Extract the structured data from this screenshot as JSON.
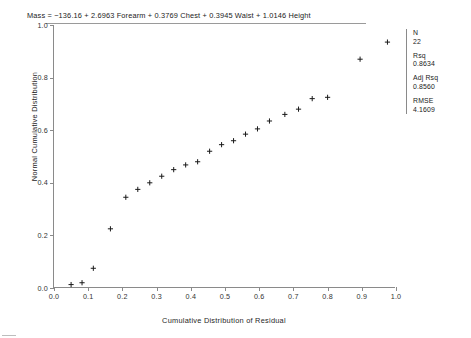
{
  "equation": {
    "label": "Mass",
    "text": "Mass  =   −136.16  + 2.6963 Forearm  + 0.3769 Chest  + 0.3945 Waist  + 1.0146 Height"
  },
  "stats": {
    "n_label": "N",
    "n_value": "22",
    "rsq_label": "Rsq",
    "rsq_value": "0.8634",
    "adj_rsq_label": "Adj Rsq",
    "adj_rsq_value": "0.8560",
    "rmse_label": "RMSE",
    "rmse_value": "4.1609"
  },
  "chart_data": {
    "type": "scatter",
    "title": "",
    "xlabel": "Cumulative Distribution of Residual",
    "ylabel": "Normal Cumulative Distribution",
    "xlim": [
      0.0,
      1.0
    ],
    "ylim": [
      0.0,
      1.0
    ],
    "grid": false,
    "legend": "none",
    "marker": "plus",
    "marker_color": "#1a1a1a",
    "xticks": [
      0.0,
      0.1,
      0.2,
      0.3,
      0.4,
      0.5,
      0.6,
      0.7,
      0.8,
      0.9,
      1.0
    ],
    "xticklabels": [
      "0.0",
      "0.1",
      "0.2",
      "0.3",
      "0.4",
      "0.5",
      "0.6",
      "0.7",
      "0.8",
      "0.9",
      "1.0"
    ],
    "yticks": [
      0.0,
      0.2,
      0.4,
      0.6,
      0.8,
      1.0
    ],
    "yticklabels": [
      "0.0",
      "0.2",
      "0.4",
      "0.6",
      "0.8",
      "1.0"
    ],
    "n_points": 22,
    "x": [
      0.05,
      0.082,
      0.115,
      0.165,
      0.21,
      0.245,
      0.28,
      0.315,
      0.35,
      0.385,
      0.42,
      0.455,
      0.49,
      0.525,
      0.56,
      0.595,
      0.63,
      0.675,
      0.715,
      0.755,
      0.8,
      0.895,
      0.975
    ],
    "y": [
      0.013,
      0.02,
      0.075,
      0.225,
      0.345,
      0.375,
      0.4,
      0.425,
      0.45,
      0.47,
      0.48,
      0.52,
      0.545,
      0.56,
      0.585,
      0.605,
      0.635,
      0.66,
      0.68,
      0.72,
      0.725,
      0.87,
      0.935
    ],
    "points": [
      {
        "x": 0.05,
        "y": 0.013
      },
      {
        "x": 0.082,
        "y": 0.02
      },
      {
        "x": 0.115,
        "y": 0.075
      },
      {
        "x": 0.165,
        "y": 0.225
      },
      {
        "x": 0.21,
        "y": 0.345
      },
      {
        "x": 0.245,
        "y": 0.375
      },
      {
        "x": 0.28,
        "y": 0.4
      },
      {
        "x": 0.315,
        "y": 0.425
      },
      {
        "x": 0.35,
        "y": 0.45
      },
      {
        "x": 0.385,
        "y": 0.468
      },
      {
        "x": 0.42,
        "y": 0.48
      },
      {
        "x": 0.455,
        "y": 0.52
      },
      {
        "x": 0.49,
        "y": 0.545
      },
      {
        "x": 0.525,
        "y": 0.56
      },
      {
        "x": 0.56,
        "y": 0.585
      },
      {
        "x": 0.595,
        "y": 0.605
      },
      {
        "x": 0.63,
        "y": 0.635
      },
      {
        "x": 0.675,
        "y": 0.66
      },
      {
        "x": 0.715,
        "y": 0.68
      },
      {
        "x": 0.755,
        "y": 0.72
      },
      {
        "x": 0.8,
        "y": 0.725
      },
      {
        "x": 0.895,
        "y": 0.87
      },
      {
        "x": 0.975,
        "y": 0.935
      }
    ]
  }
}
